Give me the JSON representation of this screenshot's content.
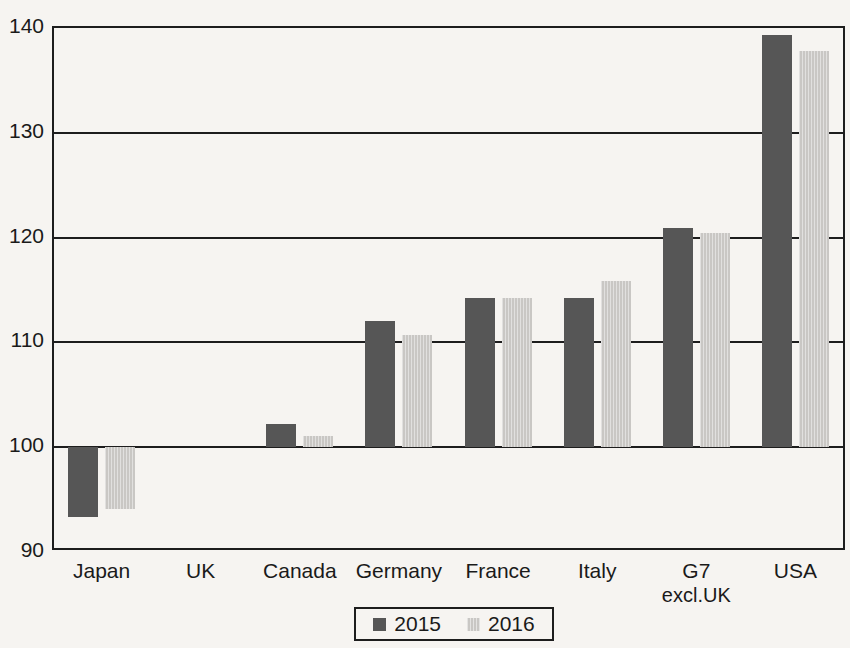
{
  "chart_data": {
    "type": "bar",
    "title": "",
    "subtitle": "",
    "xlabel": "",
    "ylabel": "",
    "ylim": [
      90,
      140
    ],
    "yticks": [
      90,
      100,
      110,
      120,
      130,
      140
    ],
    "ytick_labels": [
      "90",
      "100",
      "110",
      "120",
      "130",
      "140"
    ],
    "grid": true,
    "baseline": 100,
    "legend_position": "bottom-center",
    "categories": [
      "Japan",
      "UK",
      "Canada",
      "Germany",
      "France",
      "Italy",
      "G7 excl.UK",
      "USA"
    ],
    "category_labels": [
      {
        "line1": "Japan",
        "line2": ""
      },
      {
        "line1": "UK",
        "line2": ""
      },
      {
        "line1": "Canada",
        "line2": ""
      },
      {
        "line1": "Germany",
        "line2": ""
      },
      {
        "line1": "France",
        "line2": ""
      },
      {
        "line1": "Italy",
        "line2": ""
      },
      {
        "line1": "G7",
        "line2": "excl.UK"
      },
      {
        "line1": "USA",
        "line2": ""
      }
    ],
    "series": [
      {
        "name": "2015",
        "color": "#565656",
        "values": [
          93.3,
          100.0,
          102.2,
          112.0,
          114.2,
          114.2,
          120.9,
          139.3
        ]
      },
      {
        "name": "2016",
        "color": "#c9c7c4",
        "values": [
          94.1,
          100.0,
          101.1,
          110.7,
          114.2,
          115.9,
          120.4,
          137.8
        ]
      }
    ]
  },
  "legend": {
    "entries": [
      {
        "label": "2015",
        "swatch": "dark-gray-square"
      },
      {
        "label": "2016",
        "swatch": "light-gray-square"
      }
    ]
  },
  "colors": {
    "series_2015": "#565656",
    "series_2016": "#c9c7c4",
    "axis": "#1d1d1d",
    "background": "#f6f4f1",
    "text": "#1a1a1a"
  }
}
